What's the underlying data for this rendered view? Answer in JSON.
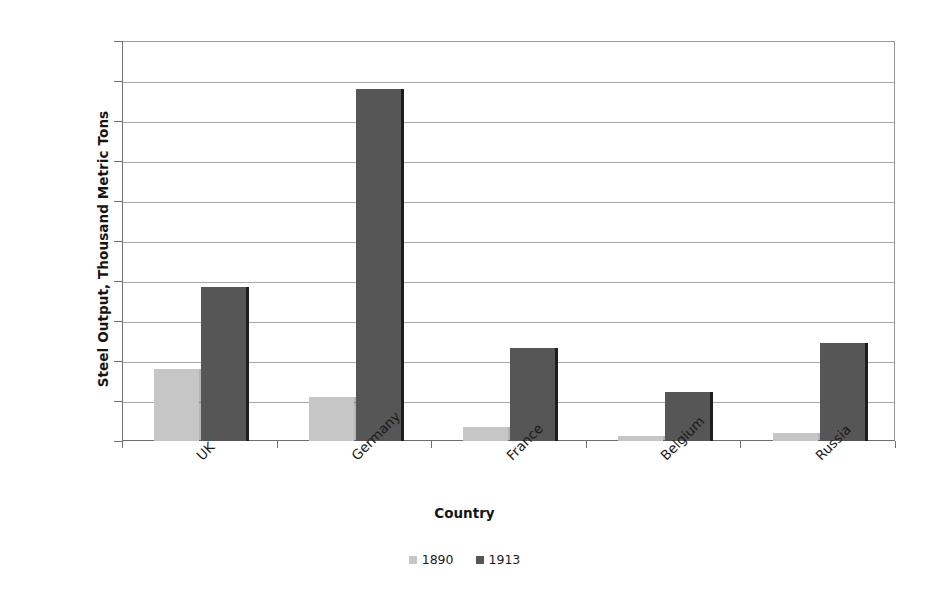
{
  "chart_data": {
    "type": "bar",
    "title": "",
    "xlabel": "Country",
    "ylabel": "Steel Output, Thousand Metric Tons",
    "categories": [
      "UK",
      "Germany",
      "France",
      "Belgium",
      "Russia"
    ],
    "series": [
      {
        "name": "1890",
        "color": "#c6c6c6",
        "values": [
          3600,
          2200,
          700,
          250,
          380
        ]
      },
      {
        "name": "1913",
        "color": "#565656",
        "values": [
          7700,
          17600,
          4650,
          2450,
          4900
        ]
      }
    ],
    "ylim": [
      0,
      20000
    ],
    "ytick_step": 2000,
    "yticks": [
      0,
      2000,
      4000,
      6000,
      8000,
      10000,
      12000,
      14000,
      16000,
      18000,
      20000
    ],
    "ytick_labels": [
      "0",
      "2000",
      "4000",
      "6000",
      "8000",
      "10000",
      "12000",
      "14000",
      "16000",
      "18000",
      "20000"
    ],
    "grid": true,
    "grid_axis": "y",
    "legend_position": "bottom",
    "category_label_rotation": -45,
    "background_color": "#ffffff",
    "axis_color": "#6e6e6e",
    "gridline_color": "#a8a8a8"
  }
}
